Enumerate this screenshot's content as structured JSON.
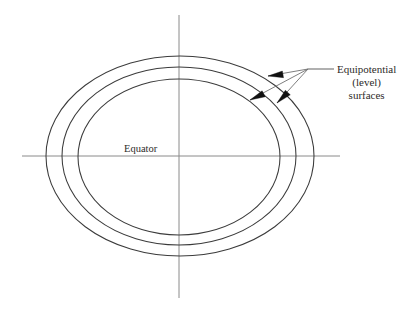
{
  "figure": {
    "name": "equipotential-surfaces-diagram",
    "width": 410,
    "height": 314,
    "background_color": "#ffffff"
  },
  "colors": {
    "curve_stroke": "#3b3b3b",
    "axis_stroke": "#8a8a8a",
    "leader_stroke": "#6f6f6f",
    "arrow_fill": "#111111",
    "text_color": "#2e2b29"
  },
  "axes": {
    "horizontal": {
      "label": "Equator",
      "x1": 22,
      "y1": 156,
      "x2": 340,
      "y2": 156
    },
    "vertical": {
      "label": "",
      "x1": 179,
      "y1": 15,
      "x2": 179,
      "y2": 298
    }
  },
  "labels": {
    "equator": {
      "text": "Equator",
      "x": 124,
      "y": 152
    },
    "callout": {
      "line1": "Equipotential",
      "line2": "(level)",
      "line3": "surfaces",
      "x": 337,
      "y1": 73,
      "y2": 86,
      "y3": 99
    }
  },
  "curves": [
    {
      "name": "outer-equipotential-surface",
      "cx": 180,
      "cy": 156,
      "rx": 134,
      "ry": 100
    },
    {
      "name": "middle-equipotential-surface",
      "cx": 179,
      "cy": 156,
      "rx": 117,
      "ry": 89
    },
    {
      "name": "inner-equipotential-surface",
      "cx": 179,
      "cy": 157,
      "rx": 101,
      "ry": 78
    }
  ],
  "leaders": {
    "origin_x": 308,
    "origin_y": 69,
    "stem_x2": 334,
    "stem_y2": 69,
    "arrows": [
      {
        "name": "leader-arrow-outer",
        "tip_x": 268,
        "tip_y": 76,
        "tail_x": 308,
        "tail_y": 69
      },
      {
        "name": "leader-arrow-inner",
        "tip_x": 250,
        "tip_y": 100,
        "tail_x": 308,
        "tail_y": 69
      },
      {
        "name": "leader-arrow-middle",
        "tip_x": 277,
        "tip_y": 103,
        "tail_x": 308,
        "tail_y": 69
      }
    ]
  }
}
